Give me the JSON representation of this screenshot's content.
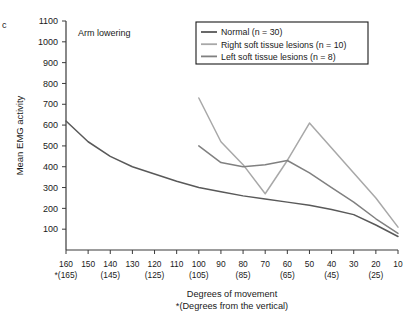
{
  "panel": {
    "label": "c"
  },
  "annotation": {
    "text": "Arm lowering"
  },
  "legend": {
    "items": [
      {
        "label": "Normal (n = 30)",
        "color": "#595959"
      },
      {
        "label": "Right soft tissue lesions (n = 10)",
        "color": "#a8a8a8"
      },
      {
        "label": "Left soft tissue lesions (n = 8)",
        "color": "#808080"
      }
    ]
  },
  "axes": {
    "ylabel": "Mean EMG activity",
    "xlabel_line1": "Degrees of movement",
    "xlabel_line2": "*(Degrees from the vertical)",
    "yticks": [
      100,
      200,
      300,
      400,
      500,
      600,
      700,
      800,
      900,
      1000,
      1100
    ],
    "xticks": [
      160,
      150,
      140,
      130,
      120,
      110,
      100,
      90,
      80,
      70,
      60,
      50,
      40,
      30,
      20,
      10
    ],
    "xticks_sub": [
      "*(165)",
      "",
      "(145)",
      "",
      "(125)",
      "",
      "(105)",
      "",
      "(85)",
      "",
      "(65)",
      "",
      "(45)",
      "",
      "(25)",
      ""
    ]
  },
  "chart_data": {
    "type": "line",
    "title": "Arm lowering",
    "xlabel": "Degrees of movement *(Degrees from the vertical)",
    "ylabel": "Mean EMG activity",
    "xlim": [
      160,
      10
    ],
    "ylim": [
      0,
      1100
    ],
    "x_reversed": true,
    "grid": false,
    "legend_position": "top-right",
    "series": [
      {
        "name": "Normal (n = 30)",
        "color": "#595959",
        "x": [
          160,
          150,
          140,
          130,
          120,
          110,
          100,
          90,
          80,
          70,
          60,
          50,
          40,
          30,
          20,
          10
        ],
        "values": [
          620,
          520,
          450,
          400,
          365,
          330,
          300,
          280,
          260,
          245,
          230,
          215,
          195,
          170,
          120,
          65
        ]
      },
      {
        "name": "Right soft tissue lesions (n = 10)",
        "color": "#a8a8a8",
        "x": [
          100,
          90,
          80,
          70,
          60,
          50,
          40,
          30,
          20,
          10
        ],
        "values": [
          730,
          520,
          410,
          270,
          430,
          610,
          490,
          370,
          250,
          110
        ]
      },
      {
        "name": "Left soft tissue lesions (n = 8)",
        "color": "#808080",
        "x": [
          100,
          90,
          80,
          70,
          60,
          50,
          40,
          30,
          20,
          10
        ],
        "values": [
          500,
          420,
          400,
          410,
          430,
          370,
          300,
          230,
          150,
          80
        ]
      }
    ]
  }
}
